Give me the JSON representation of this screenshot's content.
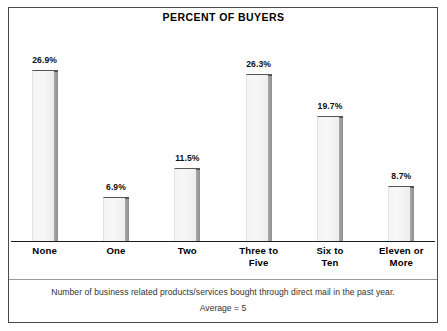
{
  "chart_data": {
    "type": "bar",
    "title": "PERCENT OF BUYERS",
    "xlabel": "",
    "ylabel": "",
    "ylim": [
      0,
      30
    ],
    "grid": false,
    "legend": null,
    "axis_line": "baseline-only",
    "categories": [
      "None",
      "One",
      "Two",
      "Three to Five",
      "Six to Ten",
      "Eleven or More"
    ],
    "category_lines": [
      [
        "None",
        ""
      ],
      [
        "One",
        ""
      ],
      [
        "Two",
        ""
      ],
      [
        "Three to",
        "Five"
      ],
      [
        "Six to",
        "Ten"
      ],
      [
        "Eleven or",
        "More"
      ]
    ],
    "values": [
      26.9,
      6.9,
      11.5,
      26.3,
      19.7,
      8.7
    ],
    "value_labels": [
      "26.9%",
      "6.9%",
      "11.5%",
      "26.3%",
      "19.7%",
      "8.7%"
    ],
    "annotations": [
      "Number of business related products/services bought through direct mail in the past year.",
      "Average = 5"
    ],
    "colors": {
      "bar_fill": "#f4f4f4",
      "bar_edge": "#555555",
      "bar_shadow": "#9a9a9a",
      "axis": "#1d1d1d",
      "frame": "#4a4a4a",
      "text": "#000000",
      "footer_text": "#333333",
      "background": "#ffffff"
    }
  },
  "footer": {
    "note": "Number of business related products/services bought through direct mail in the past year.",
    "average": "Average = 5"
  }
}
